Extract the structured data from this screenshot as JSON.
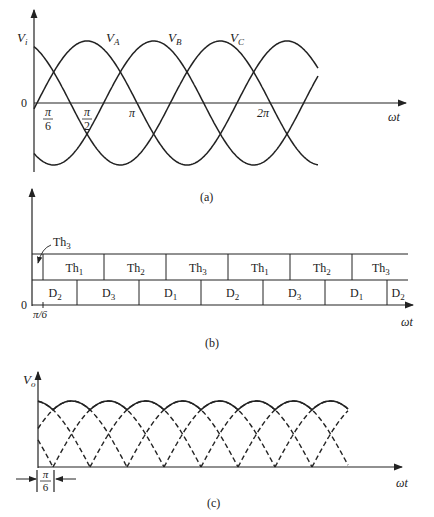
{
  "figure": {
    "captions": [
      "(a)",
      "(b)",
      "(c)"
    ]
  },
  "panel_a": {
    "y_label": "V",
    "y_label_sub": "i",
    "x_label": "ωt",
    "origin_label": "0",
    "ticks": [
      {
        "num": "π",
        "den": "6"
      },
      {
        "num": "π",
        "den": "2"
      },
      {
        "label": "π"
      },
      {
        "label": "2π"
      }
    ],
    "curves": [
      {
        "name": "V",
        "sub": "A",
        "phase_deg": 0
      },
      {
        "name": "V",
        "sub": "B",
        "phase_deg": -120
      },
      {
        "name": "V",
        "sub": "C",
        "phase_deg": -240
      }
    ]
  },
  "panel_b": {
    "x_label": "ωt",
    "origin_label": "0",
    "tick_label": "π/6",
    "pointer_label": {
      "main": "Th",
      "sub": "3"
    },
    "thyristor_row": [
      {
        "main": "Th",
        "sub": "1"
      },
      {
        "main": "Th",
        "sub": "2"
      },
      {
        "main": "Th",
        "sub": "3"
      },
      {
        "main": "Th",
        "sub": "1"
      },
      {
        "main": "Th",
        "sub": "2"
      },
      {
        "main": "Th",
        "sub": "3"
      }
    ],
    "diode_row": [
      {
        "main": "D",
        "sub": "2"
      },
      {
        "main": "D",
        "sub": "3"
      },
      {
        "main": "D",
        "sub": "1"
      },
      {
        "main": "D",
        "sub": "2"
      },
      {
        "main": "D",
        "sub": "3"
      },
      {
        "main": "D",
        "sub": "1"
      },
      {
        "main": "D",
        "sub": "2"
      }
    ]
  },
  "panel_c": {
    "y_label": "V",
    "y_label_sub": "o",
    "x_label": "ωt",
    "offset_annotation": {
      "num": "π",
      "den": "6"
    }
  }
}
